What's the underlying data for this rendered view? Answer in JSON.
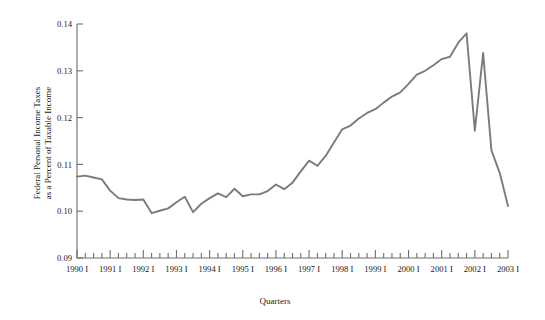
{
  "chart_data": {
    "type": "line",
    "title": "",
    "xlabel": "Quarters",
    "ylabel": "Federal Personal Income Taxes as a Percent of Taxable Income",
    "ylabel_line1": "Federal Personal Income Taxes",
    "ylabel_line2": "as a Percent of Taxable Income",
    "ylim": [
      0.09,
      0.14
    ],
    "y_ticks": [
      0.09,
      0.1,
      0.11,
      0.12,
      0.13,
      0.14
    ],
    "y_tick_labels": [
      "0.09",
      "0.10",
      "0.11",
      "0.12",
      "0.13",
      "0.14"
    ],
    "xlim": [
      "1990 I",
      "2003 I"
    ],
    "x_tick_labels": [
      "1990 I",
      "1991 I",
      "1992 I",
      "1993 I",
      "1994 I",
      "1995 I",
      "1996 I",
      "1997 I",
      "1998 I",
      "1999 I",
      "2000 I",
      "2001 I",
      "2002 I",
      "2003 I"
    ],
    "x_minor_ticks_per_year": 4,
    "grid": false,
    "legend": "none",
    "line_color": "#7b7b7b",
    "axis_color": "#6e6e6e",
    "categories": [
      "1990 I",
      "1990 II",
      "1990 III",
      "1990 IV",
      "1991 I",
      "1991 II",
      "1991 III",
      "1991 IV",
      "1992 I",
      "1992 II",
      "1992 III",
      "1992 IV",
      "1993 I",
      "1993 II",
      "1993 III",
      "1993 IV",
      "1994 I",
      "1994 II",
      "1994 III",
      "1994 IV",
      "1995 I",
      "1995 II",
      "1995 III",
      "1995 IV",
      "1996 I",
      "1996 II",
      "1996 III",
      "1996 IV",
      "1997 I",
      "1997 II",
      "1997 III",
      "1997 IV",
      "1998 I",
      "1998 II",
      "1998 III",
      "1998 IV",
      "1999 I",
      "1999 II",
      "1999 III",
      "1999 IV",
      "2000 I",
      "2000 II",
      "2000 III",
      "2000 IV",
      "2001 I",
      "2001 II",
      "2001 III",
      "2001 IV",
      "2002 I",
      "2002 II",
      "2002 III",
      "2002 IV",
      "2003 I"
    ],
    "values": [
      0.1074,
      0.1076,
      0.1072,
      0.1068,
      0.1044,
      0.1028,
      0.1025,
      0.1024,
      0.1025,
      0.0996,
      0.1001,
      0.1006,
      0.1019,
      0.1031,
      0.0998,
      0.1016,
      0.1028,
      0.1038,
      0.103,
      0.1048,
      0.1032,
      0.1036,
      0.1036,
      0.1043,
      0.1057,
      0.1047,
      0.1061,
      0.1085,
      0.1108,
      0.1097,
      0.1118,
      0.1147,
      0.1175,
      0.1183,
      0.1198,
      0.121,
      0.1218,
      0.1232,
      0.1245,
      0.1254,
      0.1272,
      0.1292,
      0.13,
      0.1312,
      0.1325,
      0.133,
      0.136,
      0.138,
      0.1172,
      0.1338,
      0.113,
      0.1082,
      0.1011
    ],
    "annotations": {
      "peak_value": 0.138,
      "peak_period": "2001 IV",
      "trough_value": 0.0996,
      "trough_period": "1992 II",
      "final_value": 0.1011,
      "final_period": "2003 I"
    }
  }
}
